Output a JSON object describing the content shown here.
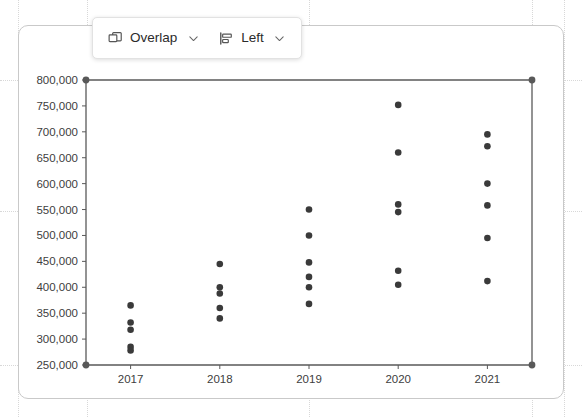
{
  "toolbar": {
    "items": [
      {
        "icon": "overlap-icon",
        "label": "Overlap",
        "caret": "chevron-down-icon"
      },
      {
        "icon": "align-left-icon",
        "label": "Left",
        "caret": "chevron-down-icon"
      }
    ]
  },
  "colors": {
    "axis": "#595959",
    "dot": "#3a3a3a",
    "card_border": "#c9c9c9",
    "grid": "#d8d8d8",
    "tick_text": "#404040"
  },
  "chart_data": {
    "type": "scatter",
    "title": "",
    "xlabel": "",
    "ylabel": "",
    "categories": [
      "2017",
      "2018",
      "2019",
      "2020",
      "2021"
    ],
    "ylim": [
      250000,
      800000
    ],
    "ytick_labels": [
      "800,000",
      "750,000",
      "700,000",
      "650,000",
      "600,000",
      "550,000",
      "500,000",
      "450,000",
      "400,000",
      "350,000",
      "300,000",
      "250,000"
    ],
    "ytick_values": [
      800000,
      750000,
      700000,
      650000,
      600000,
      550000,
      500000,
      450000,
      400000,
      350000,
      300000,
      250000
    ],
    "grid": false,
    "legend": "none",
    "series": [
      {
        "name": "values",
        "points": [
          {
            "x": "2017",
            "y": 365000
          },
          {
            "x": "2017",
            "y": 332000
          },
          {
            "x": "2017",
            "y": 318000
          },
          {
            "x": "2017",
            "y": 285000
          },
          {
            "x": "2017",
            "y": 278000
          },
          {
            "x": "2018",
            "y": 445000
          },
          {
            "x": "2018",
            "y": 400000
          },
          {
            "x": "2018",
            "y": 388000
          },
          {
            "x": "2018",
            "y": 360000
          },
          {
            "x": "2018",
            "y": 340000
          },
          {
            "x": "2019",
            "y": 550000
          },
          {
            "x": "2019",
            "y": 500000
          },
          {
            "x": "2019",
            "y": 448000
          },
          {
            "x": "2019",
            "y": 420000
          },
          {
            "x": "2019",
            "y": 400000
          },
          {
            "x": "2019",
            "y": 368000
          },
          {
            "x": "2020",
            "y": 752000
          },
          {
            "x": "2020",
            "y": 660000
          },
          {
            "x": "2020",
            "y": 560000
          },
          {
            "x": "2020",
            "y": 545000
          },
          {
            "x": "2020",
            "y": 432000
          },
          {
            "x": "2020",
            "y": 405000
          },
          {
            "x": "2021",
            "y": 695000
          },
          {
            "x": "2021",
            "y": 672000
          },
          {
            "x": "2021",
            "y": 600000
          },
          {
            "x": "2021",
            "y": 558000
          },
          {
            "x": "2021",
            "y": 495000
          },
          {
            "x": "2021",
            "y": 412000
          }
        ]
      }
    ]
  }
}
